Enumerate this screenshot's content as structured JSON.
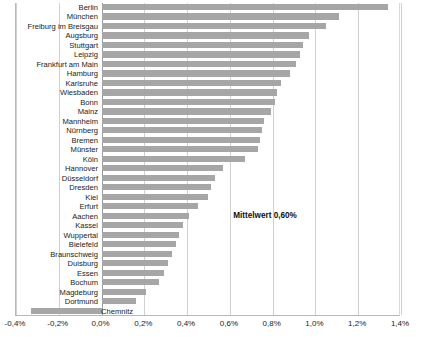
{
  "chart_data": {
    "type": "bar",
    "orientation": "horizontal",
    "title": "",
    "xlabel": "",
    "ylabel": "",
    "xlim": [
      -0.4,
      1.4
    ],
    "xtick_values": [
      -0.4,
      -0.2,
      0.0,
      0.2,
      0.4,
      0.6,
      0.8,
      1.0,
      1.2,
      1.4
    ],
    "xtick_labels": [
      "-0,4%",
      "-0,2%",
      "0,0%",
      "0,2%",
      "0,4%",
      "0,6%",
      "0,8%",
      "1,0%",
      "1,2%",
      "1,4%"
    ],
    "grid": true,
    "legend": false,
    "bar_color": "#a6a6a6",
    "categories": [
      "Berlin",
      "München",
      "Freiburg im Breisgau",
      "Augsburg",
      "Stuttgart",
      "Leipzig",
      "Frankfurt am Main",
      "Hamburg",
      "Karlsruhe",
      "Wiesbaden",
      "Bonn",
      "Mainz",
      "Mannheim",
      "Nürnberg",
      "Bremen",
      "Münster",
      "Köln",
      "Hannover",
      "Düsseldorf",
      "Dresden",
      "Kiel",
      "Erfurt",
      "Aachen",
      "Kassel",
      "Wuppertal",
      "Bielefeld",
      "Braunschweig",
      "Duisburg",
      "Essen",
      "Bochum",
      "Magdeburg",
      "Dortmund",
      "Chemnitz"
    ],
    "values": [
      1.34,
      1.11,
      1.05,
      0.97,
      0.94,
      0.93,
      0.91,
      0.88,
      0.84,
      0.82,
      0.81,
      0.79,
      0.76,
      0.75,
      0.74,
      0.73,
      0.67,
      0.57,
      0.53,
      0.51,
      0.5,
      0.45,
      0.41,
      0.38,
      0.36,
      0.35,
      0.33,
      0.31,
      0.29,
      0.27,
      0.21,
      0.16,
      -0.33
    ],
    "annotations": [
      {
        "name": "mean-annotation",
        "text": "Mittelwert 0,60%",
        "x": 0.62,
        "y_index": 22
      }
    ]
  }
}
